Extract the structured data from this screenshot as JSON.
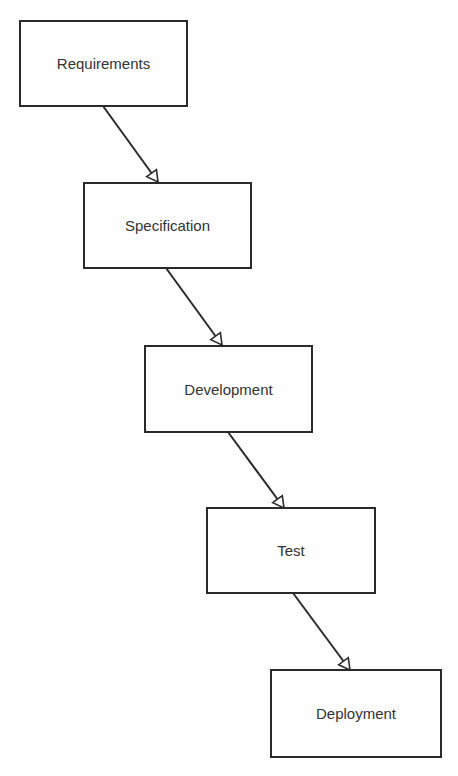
{
  "diagram": {
    "type": "waterfall-process",
    "stages": [
      {
        "label": "Requirements"
      },
      {
        "label": "Specification"
      },
      {
        "label": "Development"
      },
      {
        "label": "Test"
      },
      {
        "label": "Deployment"
      }
    ],
    "edges": [
      {
        "from": "Requirements",
        "to": "Specification"
      },
      {
        "from": "Specification",
        "to": "Development"
      },
      {
        "from": "Development",
        "to": "Test"
      },
      {
        "from": "Test",
        "to": "Deployment"
      }
    ],
    "colors": {
      "stroke": "#2a2a2a",
      "text": "#333333",
      "background": "#ffffff"
    }
  }
}
